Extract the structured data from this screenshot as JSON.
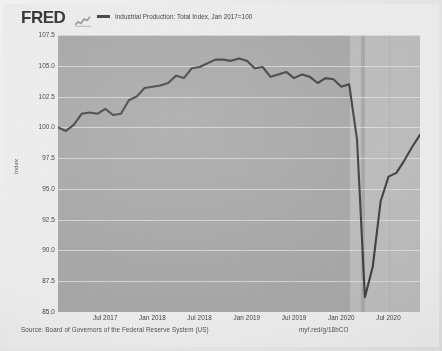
{
  "header": {
    "logo_text": "FRED",
    "logo_mark_icon": "sparkline-icon",
    "legend": [
      {
        "label": "Industrial Production: Total Index, Jan 2017=100",
        "color": "#3b3b3b"
      }
    ]
  },
  "footer": {
    "source": "Source: Board of Governors of the Federal Reserve System (US)",
    "short_link": "myf.red/g/18bCO"
  },
  "chart_data": {
    "type": "line",
    "title": "",
    "subtitle": "",
    "xlabel": "",
    "ylabel": "Index",
    "ylim": [
      85.0,
      107.5
    ],
    "yticks": [
      "107.5",
      "105.0",
      "102.5",
      "100.0",
      "97.5",
      "95.0",
      "92.5",
      "90.0",
      "87.5",
      "85.0"
    ],
    "ytick_values": [
      107.5,
      105.0,
      102.5,
      100.0,
      97.5,
      95.0,
      92.5,
      90.0,
      87.5,
      85.0
    ],
    "xticks": [
      "Jul 2017",
      "Jan 2018",
      "Jul 2018",
      "Jan 2019",
      "Jul 2019",
      "Jan 2020",
      "Jul 2020"
    ],
    "xtick_positions": [
      0.1304,
      0.2609,
      0.3913,
      0.5217,
      0.6522,
      0.7826,
      0.913
    ],
    "grid": true,
    "legend_position": "top",
    "line_color": "#3b3b3b",
    "plot_background": "#a9a9a8",
    "recession_shading_color": "#bfbfbe",
    "recession_bands": [
      {
        "start": 0.808,
        "end": 0.837
      },
      {
        "start": 0.848,
        "end": 1.0
      }
    ],
    "x": [
      "2017-01",
      "2017-02",
      "2017-03",
      "2017-04",
      "2017-05",
      "2017-06",
      "2017-07",
      "2017-08",
      "2017-09",
      "2017-10",
      "2017-11",
      "2017-12",
      "2018-01",
      "2018-02",
      "2018-03",
      "2018-04",
      "2018-05",
      "2018-06",
      "2018-07",
      "2018-08",
      "2018-09",
      "2018-10",
      "2018-11",
      "2018-12",
      "2019-01",
      "2019-02",
      "2019-03",
      "2019-04",
      "2019-05",
      "2019-06",
      "2019-07",
      "2019-08",
      "2019-09",
      "2019-10",
      "2019-11",
      "2019-12",
      "2020-01",
      "2020-02",
      "2020-03",
      "2020-04",
      "2020-05",
      "2020-06",
      "2020-07",
      "2020-08",
      "2020-09",
      "2020-10",
      "2020-11"
    ],
    "series": [
      {
        "name": "Industrial Production: Total Index, Jan 2017=100",
        "values": [
          100.0,
          99.7,
          100.2,
          101.1,
          101.2,
          101.1,
          101.5,
          101.0,
          101.1,
          102.2,
          102.5,
          103.2,
          103.3,
          103.4,
          103.6,
          104.2,
          104.0,
          104.8,
          104.9,
          105.2,
          105.5,
          105.5,
          105.4,
          105.6,
          105.4,
          104.8,
          104.9,
          104.1,
          104.3,
          104.5,
          104.0,
          104.3,
          104.1,
          103.6,
          104.0,
          103.9,
          103.3,
          103.5,
          99.0,
          86.2,
          88.7,
          94.0,
          96.0,
          96.3,
          97.3,
          98.4,
          99.4
        ]
      }
    ],
    "annotations": [],
    "min_point": {
      "x": "2020-04",
      "y": 86.2
    },
    "max_point": {
      "x": "2018-09",
      "y": 105.5
    },
    "last_point": {
      "x": "2020-11",
      "y": 99.4
    }
  }
}
